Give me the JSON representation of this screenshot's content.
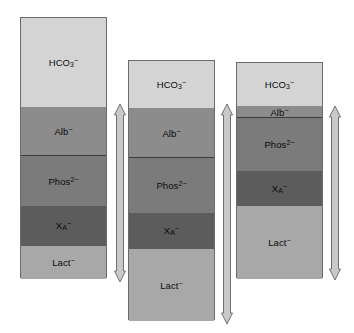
{
  "figure": {
    "type": "stacked-bar-diagram",
    "background": "#ffffff"
  },
  "palette": {
    "hco3": "#d4d4d4",
    "alb": "#8c8c8c",
    "phos": "#7b7b7b",
    "xa": "#5c5c5c",
    "lact": "#a8a8a8",
    "outline": "#6b6b6b",
    "divider": "#3a3a3a",
    "arrow_fill": "#c9c9c9",
    "arrow_stroke": "#6f6f6f",
    "text": "#0a0a0a"
  },
  "labels": {
    "bicarbonate": "HCO",
    "bicarbonate_sub": "3",
    "bicarbonate_sup": "−",
    "albumin": "Alb",
    "albumin_sup": "−",
    "phosphate": "Phos",
    "phosphate_sup": "2−",
    "unmeasured": "X",
    "unmeasured_sub": "A",
    "unmeasured_sup": "−",
    "lactate": "Lact",
    "lactate_sup": "−"
  },
  "chart_data": {
    "type": "bar",
    "xlabel": "",
    "ylabel": "",
    "grid": false,
    "legend_position": "none",
    "categories": [
      "Column 1",
      "Column 2",
      "Column 3"
    ],
    "series": [
      {
        "name": "HCO3-",
        "color": "#d4d4d4",
        "values": [
          89,
          47,
          43
        ]
      },
      {
        "name": "Alb-",
        "color": "#8c8c8c",
        "values": [
          49,
          50,
          12
        ]
      },
      {
        "name": "Phos2-",
        "color": "#7b7b7b",
        "values": [
          50,
          55,
          53
        ]
      },
      {
        "name": "XA-",
        "color": "#5c5c5c",
        "values": [
          40,
          36,
          35
        ]
      },
      {
        "name": "Lact-",
        "color": "#a8a8a8",
        "values": [
          33,
          72,
          73
        ]
      }
    ]
  },
  "columns": [
    {
      "name": "column-1",
      "x": 20,
      "y": 17,
      "width": 87,
      "height": 261,
      "segments": [
        {
          "key": "hco3",
          "label_key": "bicarbonate",
          "top": 0,
          "height": 89,
          "color": "#d4d4d4",
          "divider_below": false
        },
        {
          "key": "alb",
          "label_key": "albumin",
          "top": 89,
          "height": 49,
          "color": "#8c8c8c",
          "divider_below": true
        },
        {
          "key": "phos",
          "label_key": "phosphate",
          "top": 138,
          "height": 50,
          "color": "#7b7b7b",
          "divider_below": false
        },
        {
          "key": "xa",
          "label_key": "unmeasured",
          "top": 188,
          "height": 40,
          "color": "#5c5c5c",
          "divider_below": false
        },
        {
          "key": "lact",
          "label_key": "lactate",
          "top": 228,
          "height": 33,
          "color": "#a8a8a8",
          "divider_below": false
        }
      ],
      "arrow": {
        "x": 112,
        "y_top": 104,
        "y_bottom": 282
      }
    },
    {
      "name": "column-2",
      "x": 128,
      "y": 60,
      "width": 87,
      "height": 260,
      "segments": [
        {
          "key": "hco3",
          "label_key": "bicarbonate",
          "top": 0,
          "height": 47,
          "color": "#d4d4d4",
          "divider_below": false
        },
        {
          "key": "alb",
          "label_key": "albumin",
          "top": 47,
          "height": 50,
          "color": "#8c8c8c",
          "divider_below": true
        },
        {
          "key": "phos",
          "label_key": "phosphate",
          "top": 97,
          "height": 55,
          "color": "#7b7b7b",
          "divider_below": false
        },
        {
          "key": "xa",
          "label_key": "unmeasured",
          "top": 152,
          "height": 36,
          "color": "#5c5c5c",
          "divider_below": false
        },
        {
          "key": "lact",
          "label_key": "lactate",
          "top": 188,
          "height": 72,
          "color": "#a8a8a8",
          "divider_below": false
        }
      ],
      "arrow": {
        "x": 219,
        "y_top": 104,
        "y_bottom": 324
      }
    },
    {
      "name": "column-3",
      "x": 236,
      "y": 62,
      "width": 87,
      "height": 216,
      "segments": [
        {
          "key": "hco3",
          "label_key": "bicarbonate",
          "top": 0,
          "height": 43,
          "color": "#d4d4d4",
          "divider_below": false
        },
        {
          "key": "alb",
          "label_key": "albumin",
          "top": 43,
          "height": 12,
          "color": "#8c8c8c",
          "divider_below": true
        },
        {
          "key": "phos",
          "label_key": "phosphate",
          "top": 55,
          "height": 53,
          "color": "#7b7b7b",
          "divider_below": false
        },
        {
          "key": "xa",
          "label_key": "unmeasured",
          "top": 108,
          "height": 35,
          "color": "#5c5c5c",
          "divider_below": false
        },
        {
          "key": "lact",
          "label_key": "lactate",
          "top": 143,
          "height": 73,
          "color": "#a8a8a8",
          "divider_below": false
        }
      ],
      "arrow": {
        "x": 327,
        "y_top": 106,
        "y_bottom": 280
      }
    }
  ]
}
